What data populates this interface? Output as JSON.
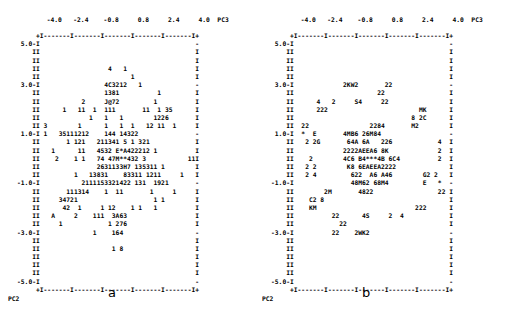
{
  "figure": {
    "type": "ascii-scatter-pair",
    "panels": [
      {
        "letter": "a",
        "xlabel": "PC3",
        "ylabel": "PC2",
        "xticklabels": [
          "-4.0",
          "-2.4",
          "-0.8",
          "0.8",
          "2.4",
          "4.0"
        ],
        "yticklabels": [
          "5.0",
          "3.0",
          "1.0",
          "-1.0",
          "-3.0",
          "-5.0"
        ],
        "axis_top": "+I-------I-------I-------I-------I-------I+",
        "axis_bottom": "+I-------I-------I-------I-------I-------I+",
        "rows": [
          {
            "ylab": "5.0-",
            "left": "I",
            "cells": "",
            "right": "-"
          },
          {
            "ylab": "I",
            "left": "I",
            "cells": "",
            "right": "I"
          },
          {
            "ylab": "I",
            "left": "I",
            "cells": "",
            "right": "I"
          },
          {
            "ylab": "I",
            "left": "I",
            "cells": "                  4   1",
            "right": "I"
          },
          {
            "ylab": "I",
            "left": "I",
            "cells": "                        1",
            "right": "I"
          },
          {
            "ylab": "3.0-",
            "left": "I",
            "cells": "                 4C3212   1",
            "right": "-"
          },
          {
            "ylab": "I",
            "left": "I",
            "cells": "                 1381          1",
            "right": "I"
          },
          {
            "ylab": "I",
            "left": "I",
            "cells": "           2     J@72         1            16",
            "right": "I"
          },
          {
            "ylab": "I",
            "left": "I",
            "cells": "      1   11  1  111       11  1 35",
            "right": "I"
          },
          {
            "ylab": "I",
            "left": "I",
            "cells": "             1   1   1        1226",
            "right": "I"
          },
          {
            "ylab": "I",
            "left": "I",
            "cells": " 3        1      1   1  1   12 11  1",
            "right": "I"
          },
          {
            "ylab": "1.0-",
            "left": "I",
            "cells": " 1   35111212    144 14322",
            "right": "-"
          },
          {
            "ylab": "I",
            "left": "I",
            "cells": "       1 121   211341 5 1 321              1",
            "right": "I"
          },
          {
            "ylab": "I",
            "left": "I",
            "cells": "   1      11   4532 E*A422212 1",
            "right": "I"
          },
          {
            "ylab": "I",
            "left": "I",
            "cells": "    2    1 1   74 47M**432 3           11",
            "right": "I"
          },
          {
            "ylab": "I",
            "left": "I",
            "cells": "               2631133H7 135311 1",
            "right": "I"
          },
          {
            "ylab": "I",
            "left": "I",
            "cells": "         1   13831    83311 1211     1",
            "right": "I"
          },
          {
            "ylab": "-1.0-",
            "left": "I",
            "cells": "           2111153321422 131  1921",
            "right": "-"
          },
          {
            "ylab": "I",
            "left": "I",
            "cells": "       111314    1  11       1     1",
            "right": "I"
          },
          {
            "ylab": "I",
            "left": "I",
            "cells": "     34721                    1 1",
            "right": "I"
          },
          {
            "ylab": "I",
            "left": "I",
            "cells": "      42  1     1 12    1 1   1",
            "right": "I"
          },
          {
            "ylab": "I",
            "left": "I",
            "cells": "   A     2    111  3A63",
            "right": "I"
          },
          {
            "ylab": "I",
            "left": "I",
            "cells": "     1            1 276",
            "right": "I"
          },
          {
            "ylab": "-3.0-",
            "left": "I",
            "cells": "              1    164",
            "right": "-"
          },
          {
            "ylab": "I",
            "left": "I",
            "cells": "",
            "right": "I"
          },
          {
            "ylab": "I",
            "left": "I",
            "cells": "                   1 8",
            "right": "I"
          },
          {
            "ylab": "I",
            "left": "I",
            "cells": "",
            "right": "I"
          },
          {
            "ylab": "I",
            "left": "I",
            "cells": "",
            "right": "I"
          },
          {
            "ylab": "I",
            "left": "I",
            "cells": "",
            "right": "I"
          },
          {
            "ylab": "-5.0-",
            "left": "I",
            "cells": "",
            "right": "-"
          }
        ]
      },
      {
        "letter": "b",
        "xlabel": "PC3",
        "ylabel": "PC2",
        "xticklabels": [
          "-4.0",
          "-2.4",
          "-0.8",
          "0.8",
          "2.4",
          "4.0"
        ],
        "yticklabels": [
          "5.0",
          "3.0",
          "1.0",
          "-1.0",
          "-3.0",
          "-5.0"
        ],
        "axis_top": "+I-------I-------I-------I-------I-------I+",
        "axis_bottom": "+I-------I-------I-------I-------I-------I+",
        "rows": [
          {
            "ylab": "5.0-",
            "left": "I",
            "cells": "",
            "right": "-"
          },
          {
            "ylab": "I",
            "left": "I",
            "cells": "",
            "right": "I"
          },
          {
            "ylab": "I",
            "left": "I",
            "cells": "",
            "right": "I"
          },
          {
            "ylab": "I",
            "left": "I",
            "cells": "",
            "right": "I"
          },
          {
            "ylab": "I",
            "left": "I",
            "cells": "",
            "right": "I"
          },
          {
            "ylab": "3.0-",
            "left": "I",
            "cells": "             2KW2       22",
            "right": "-"
          },
          {
            "ylab": "I",
            "left": "I",
            "cells": "                      22",
            "right": "I"
          },
          {
            "ylab": "I",
            "left": "I",
            "cells": "      4   2     S4     22",
            "right": "I"
          },
          {
            "ylab": "I",
            "left": "I",
            "cells": "      222                        MK",
            "right": "I"
          },
          {
            "ylab": "I",
            "left": "I",
            "cells": "                               8 2C",
            "right": "I"
          },
          {
            "ylab": "I",
            "left": "I",
            "cells": "  22                2284       M2",
            "right": "I"
          },
          {
            "ylab": "1.0-",
            "left": "I",
            "cells": "  *  E       4MB6 26M84",
            "right": "-"
          },
          {
            "ylab": "I",
            "left": "I",
            "cells": "   2 2G       64A 6A   226            4  2",
            "right": "I"
          },
          {
            "ylab": "I",
            "left": "I",
            "cells": "             2222AEEA6 8K             2  2",
            "right": "I"
          },
          {
            "ylab": "I",
            "left": "I",
            "cells": "    2        4C6 B4***4B 6C4          2",
            "right": "I"
          },
          {
            "ylab": "I",
            "left": "I",
            "cells": "   2 2        K8 6EAEEA2222",
            "right": "I"
          },
          {
            "ylab": "I",
            "left": "I",
            "cells": "   2 4         622  A6 A46        G2 2",
            "right": "I"
          },
          {
            "ylab": "-1.0-",
            "left": "I",
            "cells": "               48M62 68M4         E   *",
            "right": "-"
          },
          {
            "ylab": "I",
            "left": "I",
            "cells": "        2M       4822                 22",
            "right": "I"
          },
          {
            "ylab": "I",
            "left": "I",
            "cells": "    C2 8",
            "right": "I"
          },
          {
            "ylab": "I",
            "left": "I",
            "cells": "    KM                          222",
            "right": "I"
          },
          {
            "ylab": "I",
            "left": "I",
            "cells": "          22      4S     2  4",
            "right": "I"
          },
          {
            "ylab": "I",
            "left": "I",
            "cells": "            22",
            "right": "I"
          },
          {
            "ylab": "-3.0-",
            "left": "I",
            "cells": "          22    2WK2",
            "right": "-"
          },
          {
            "ylab": "I",
            "left": "I",
            "cells": "",
            "right": "I"
          },
          {
            "ylab": "I",
            "left": "I",
            "cells": "",
            "right": "I"
          },
          {
            "ylab": "I",
            "left": "I",
            "cells": "",
            "right": "I"
          },
          {
            "ylab": "I",
            "left": "I",
            "cells": "",
            "right": "I"
          },
          {
            "ylab": "I",
            "left": "I",
            "cells": "",
            "right": "I"
          },
          {
            "ylab": "-5.0-",
            "left": "I",
            "cells": "",
            "right": "-"
          }
        ]
      }
    ]
  }
}
